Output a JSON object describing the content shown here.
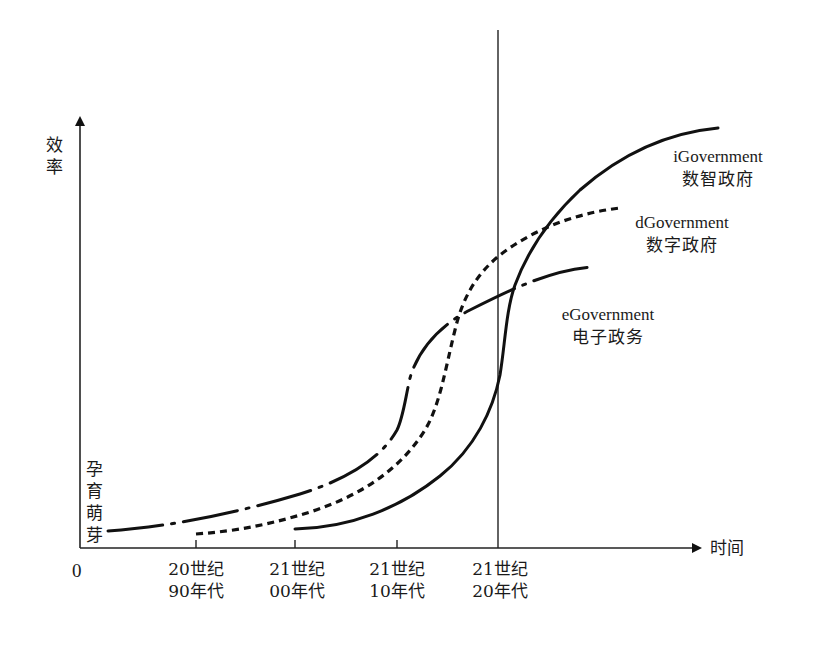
{
  "diagram": {
    "y_axis_label": "效率",
    "x_axis_label": "时间",
    "origin_label": "0",
    "initial_phase_label": "孕育萌芽",
    "x_ticks": [
      {
        "line1": "20世纪",
        "line2": "90年代"
      },
      {
        "line1": "21世纪",
        "line2": "00年代"
      },
      {
        "line1": "21世纪",
        "line2": "10年代"
      },
      {
        "line1": "21世纪",
        "line2": "20年代"
      }
    ],
    "curves": [
      {
        "id": "egov",
        "en": "eGovernment",
        "zh": "电子政务",
        "style": "dash-dot"
      },
      {
        "id": "dgov",
        "en": "dGovernment",
        "zh": "数字政府",
        "style": "dotted"
      },
      {
        "id": "igov",
        "en": "iGovernment",
        "zh": "数智政府",
        "style": "solid"
      }
    ],
    "marker_line_label": "21世纪20年代",
    "colors": {
      "line": "#111111",
      "axis": "#222222",
      "background": "#ffffff"
    }
  }
}
